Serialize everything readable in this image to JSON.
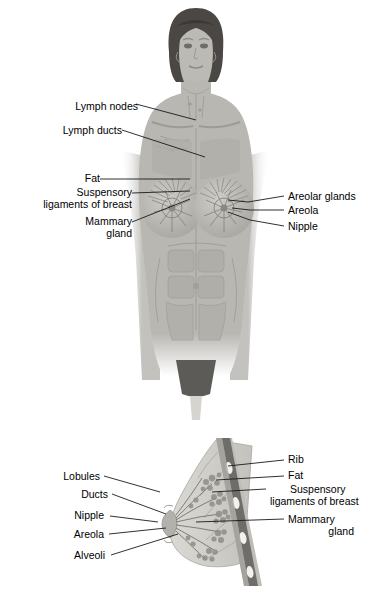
{
  "figure": {
    "title_upper": "Anterior view of female breast and lymphatic structures",
    "title_lower": "Sagittal section of the breast"
  },
  "colors": {
    "background": "#ffffff",
    "text": "#000000",
    "leader_line": "#1a1a1a",
    "skin": "#b9b7b2",
    "skin_light": "#c9c7c2",
    "hair": "#4a4744",
    "muscle": "#a8a6a1",
    "gland": "#8f8d88",
    "fat": "#d4d2cd",
    "rib": "#6f6d69",
    "pelvis": "#5d5b57"
  },
  "upper_diagram": {
    "name": "anterior-female-figure",
    "labels_left": [
      {
        "id": "lymph-nodes",
        "text": "Lymph nodes",
        "x": 78,
        "y": 107,
        "align": "right",
        "lines": [
          "Lymph nodes"
        ]
      },
      {
        "id": "lymph-ducts",
        "text": "Lymph ducts",
        "x": 55,
        "y": 131,
        "align": "right",
        "lines": [
          "Lymph ducts"
        ]
      },
      {
        "id": "fat",
        "text": "Fat",
        "x": 93,
        "y": 182,
        "align": "right",
        "lines": [
          "Fat"
        ]
      },
      {
        "id": "suspensory-ligaments",
        "text": "Suspensory ligaments of breast",
        "x": 20,
        "y": 196,
        "align": "right",
        "lines": [
          "Suspensory",
          "ligaments of breast"
        ]
      },
      {
        "id": "mammary-gland",
        "text": "Mammary gland",
        "x": 50,
        "y": 222,
        "align": "right",
        "lines": [
          "Mammary",
          "gland"
        ]
      }
    ],
    "labels_right": [
      {
        "id": "areolar-glands",
        "text": "Areolar glands",
        "x": 288,
        "y": 198,
        "align": "left",
        "lines": [
          "Areolar glands"
        ]
      },
      {
        "id": "areola",
        "text": "Areola",
        "x": 288,
        "y": 212,
        "align": "left",
        "lines": [
          "Areola"
        ]
      },
      {
        "id": "nipple",
        "text": "Nipple",
        "x": 288,
        "y": 228,
        "align": "left",
        "lines": [
          "Nipple"
        ]
      }
    ]
  },
  "lower_diagram": {
    "name": "sagittal-breast-section",
    "labels_left": [
      {
        "id": "lobules",
        "text": "Lobules",
        "x": 100,
        "y": 478,
        "align": "right",
        "lines": [
          "Lobules"
        ]
      },
      {
        "id": "ducts",
        "text": "Ducts",
        "x": 108,
        "y": 495,
        "align": "right",
        "lines": [
          "Ducts"
        ]
      },
      {
        "id": "nipple-lower",
        "text": "Nipple",
        "x": 105,
        "y": 516,
        "align": "right",
        "lines": [
          "Nipple"
        ]
      },
      {
        "id": "areola-lower",
        "text": "Areola",
        "x": 104,
        "y": 536,
        "align": "right",
        "lines": [
          "Areola"
        ]
      },
      {
        "id": "alveoli",
        "text": "Alveoli",
        "x": 106,
        "y": 557,
        "align": "right",
        "lines": [
          "Alveoli"
        ]
      }
    ],
    "labels_right": [
      {
        "id": "rib",
        "text": "Rib",
        "x": 288,
        "y": 462,
        "align": "left",
        "lines": [
          "Rib"
        ]
      },
      {
        "id": "fat-lower",
        "text": "Fat",
        "x": 288,
        "y": 478,
        "align": "left",
        "lines": [
          "Fat"
        ]
      },
      {
        "id": "suspensory-ligaments-lower",
        "text": "Suspensory ligaments of breast",
        "x": 270,
        "y": 491,
        "align": "left",
        "lines": [
          "Suspensory",
          "ligaments of breast"
        ]
      },
      {
        "id": "mammary-gland-lower",
        "text": "Mammary gland",
        "x": 288,
        "y": 521,
        "align": "left",
        "lines": [
          "Mammary",
          "gland"
        ]
      }
    ]
  }
}
